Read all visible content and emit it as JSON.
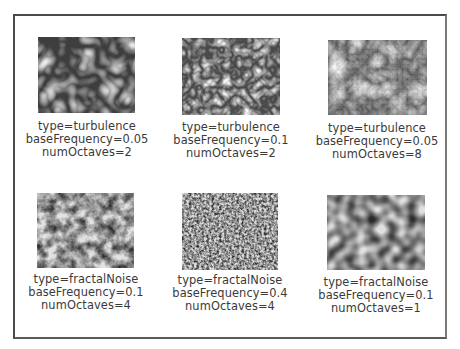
{
  "figure": {
    "samples": [
      {
        "type_label": "type=turbulence",
        "freq_label": "baseFrequency=0.05",
        "oct_label": "numOctaves=2",
        "type": "turbulence",
        "baseFrequency": 0.05,
        "numOctaves": 2
      },
      {
        "type_label": "type=turbulence",
        "freq_label": "baseFrequency=0.1",
        "oct_label": "numOctaves=2",
        "type": "turbulence",
        "baseFrequency": 0.1,
        "numOctaves": 2
      },
      {
        "type_label": "type=turbulence",
        "freq_label": "baseFrequency=0.05",
        "oct_label": "numOctaves=8",
        "type": "turbulence",
        "baseFrequency": 0.05,
        "numOctaves": 8
      },
      {
        "type_label": "type=fractalNoise",
        "freq_label": "baseFrequency=0.1",
        "oct_label": "numOctaves=4",
        "type": "fractalNoise",
        "baseFrequency": 0.1,
        "numOctaves": 4
      },
      {
        "type_label": "type=fractalNoise",
        "freq_label": "baseFrequency=0.4",
        "oct_label": "numOctaves=4",
        "type": "fractalNoise",
        "baseFrequency": 0.4,
        "numOctaves": 4
      },
      {
        "type_label": "type=fractalNoise",
        "freq_label": "baseFrequency=0.1",
        "oct_label": "numOctaves=1",
        "type": "fractalNoise",
        "baseFrequency": 0.1,
        "numOctaves": 1
      }
    ]
  },
  "colors": {
    "frame_border": "#4a4a4a",
    "caption_text": "#3a3a3a",
    "background": "#ffffff"
  }
}
